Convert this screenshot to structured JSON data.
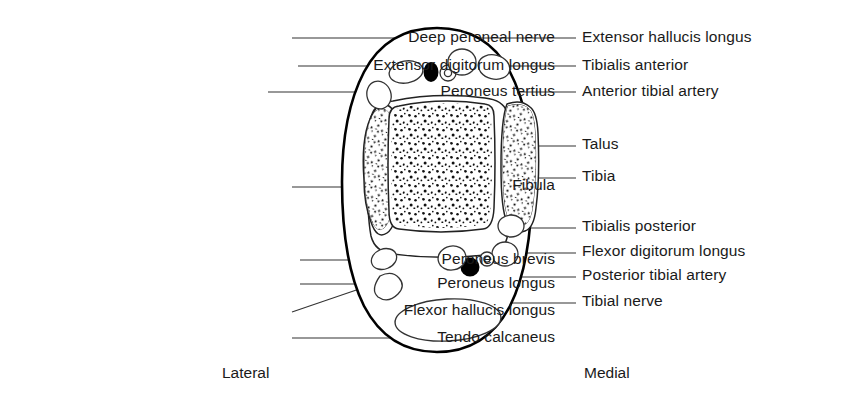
{
  "figure": {
    "orientation_captions": [
      {
        "name": "lateral",
        "text": "Lateral",
        "x": 222,
        "y": 372
      },
      {
        "name": "medial",
        "text": "Medial",
        "x": 584,
        "y": 372
      }
    ],
    "labels_left": [
      {
        "name": "deep-peroneal-nerve",
        "text": "Deep peroneal nerve",
        "right": 555,
        "top": 29
      },
      {
        "name": "extensor-digitorum-longus",
        "text": "Extensor digitorum longus",
        "right": 555,
        "top": 57
      },
      {
        "name": "peroneus-tertius",
        "text": "Peroneus tertius",
        "right": 555,
        "top": 83
      },
      {
        "name": "fibula",
        "text": "Fibula",
        "right": 555,
        "top": 177
      },
      {
        "name": "peroneus-brevis",
        "text": "Peroneus brevis",
        "right": 555,
        "top": 251
      },
      {
        "name": "peroneus-longus",
        "text": "Peroneus longus",
        "right": 555,
        "top": 275
      },
      {
        "name": "flexor-hallucis-longus",
        "text": "Flexor hallucis longus",
        "right": 555,
        "top": 302
      },
      {
        "name": "tendo-calcaneus",
        "text": "Tendo calcaneus",
        "right": 555,
        "top": 329
      }
    ],
    "labels_right": [
      {
        "name": "extensor-hallucis-longus",
        "text": "Extensor hallucis longus",
        "left": 582,
        "top": 29
      },
      {
        "name": "tibialis-anterior",
        "text": "Tibialis anterior",
        "left": 582,
        "top": 57
      },
      {
        "name": "anterior-tibial-artery",
        "text": "Anterior tibial artery",
        "left": 582,
        "top": 83
      },
      {
        "name": "talus",
        "text": "Talus",
        "left": 582,
        "top": 136
      },
      {
        "name": "tibia",
        "text": "Tibia",
        "left": 582,
        "top": 168
      },
      {
        "name": "tibialis-posterior",
        "text": "Tibialis posterior",
        "left": 582,
        "top": 218
      },
      {
        "name": "flexor-digitorum-longus",
        "text": "Flexor digitorum longus",
        "left": 582,
        "top": 243
      },
      {
        "name": "posterior-tibial-artery",
        "text": "Posterior tibial artery",
        "left": 582,
        "top": 267
      },
      {
        "name": "tibial-nerve",
        "text": "Tibial nerve",
        "left": 582,
        "top": 293
      }
    ],
    "colors": {
      "ink": "#1a1a1a",
      "outline": "#000000",
      "background": "#ffffff",
      "leader": "#333333"
    }
  }
}
